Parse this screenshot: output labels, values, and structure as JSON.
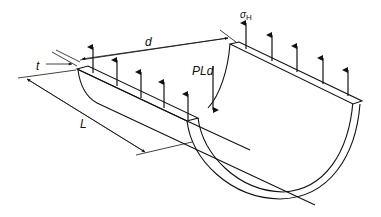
{
  "diagram": {
    "labels": {
      "diameter": "d",
      "thickness": "t",
      "length": "L",
      "force": "PLd",
      "stress_symbol": "σ",
      "stress_subscript": "H"
    },
    "colors": {
      "stroke": "#111111",
      "background": "#ffffff"
    }
  }
}
